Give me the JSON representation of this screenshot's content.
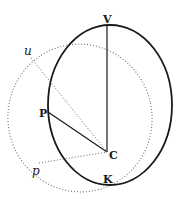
{
  "diagram": {
    "type": "geometric-figure",
    "colors": {
      "ink": "#1a1a1a",
      "dotted": "#555555",
      "background": "#ffffff"
    },
    "labels": {
      "V": "V",
      "u": "u",
      "P": "P",
      "C": "C",
      "p": "p",
      "K": "K"
    },
    "points": {
      "V": [
        107,
        25
      ],
      "C": [
        107,
        152
      ],
      "P": [
        48,
        112
      ],
      "u": [
        31,
        58
      ],
      "p": [
        39,
        163
      ],
      "K": [
        107,
        184
      ]
    },
    "shapes": [
      {
        "name": "solid-ellipse",
        "style": "solid",
        "cx": 110,
        "cy": 105,
        "rx": 62,
        "ry": 80
      },
      {
        "name": "dotted-circle",
        "style": "dotted",
        "cx": 80,
        "cy": 118,
        "rx": 72,
        "ry": 74
      }
    ],
    "segments": [
      {
        "from": "C",
        "to": "V",
        "style": "solid"
      },
      {
        "from": "C",
        "to": "P",
        "style": "solid"
      },
      {
        "from": "C",
        "to": "u",
        "style": "dotted"
      },
      {
        "from": "C",
        "to": "p",
        "style": "dotted"
      }
    ]
  }
}
